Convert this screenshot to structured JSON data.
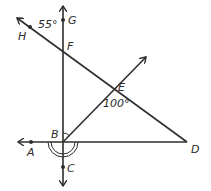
{
  "diagram": {
    "type": "geometry-angles",
    "points": {
      "A": {
        "label": "A",
        "x": 31,
        "y": 142
      },
      "B": {
        "label": "B",
        "x": 63,
        "y": 142
      },
      "C": {
        "label": "C",
        "x": 63,
        "y": 167
      },
      "D": {
        "label": "D",
        "x": 187,
        "y": 142
      },
      "E": {
        "label": "E",
        "x": 115,
        "y": 91
      },
      "F": {
        "label": "F",
        "x": 63,
        "y": 50
      },
      "G": {
        "label": "G",
        "x": 63,
        "y": 20
      },
      "H": {
        "label": "H",
        "x": 30,
        "y": 27
      }
    },
    "angles": {
      "angle_HFG": "55°",
      "angle_BED": "100°"
    },
    "lines": [
      {
        "name": "line-GC",
        "through": [
          "G",
          "F",
          "B",
          "C"
        ],
        "arrows": "both"
      },
      {
        "name": "ray-BA",
        "through": [
          "B",
          "A"
        ],
        "arrows": "A-end"
      },
      {
        "name": "segment-BD",
        "through": [
          "B",
          "D"
        ]
      },
      {
        "name": "ray-HD",
        "through": [
          "H",
          "F",
          "E",
          "D"
        ],
        "arrows": "H-end"
      },
      {
        "name": "ray-BE",
        "through": [
          "B",
          "E"
        ],
        "arrows": "E-end"
      }
    ],
    "marks": {
      "right_angle_at": "B (between BF and BE)",
      "double_arc_at": "B (angle ABC region / reflex)"
    }
  }
}
